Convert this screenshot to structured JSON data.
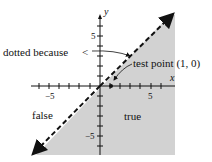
{
  "figure": {
    "type": "inequality-graph",
    "boundary": "y = x",
    "boundary_style": "dashed",
    "shaded_side": "below-right",
    "colors": {
      "shade": "#d2d2d2",
      "line": "#111111",
      "background": "#ffffff"
    }
  },
  "axes": {
    "x_label": "x",
    "y_label": "y",
    "x_ticks": {
      "neg": "−5",
      "pos": "5"
    },
    "y_ticks": {
      "pos": "5",
      "neg": "−5"
    }
  },
  "annotations": {
    "dotted_because": "dotted because",
    "less_than": "<",
    "test_point": "test point (1, 0)",
    "false_region": "false",
    "true_region": "true"
  }
}
